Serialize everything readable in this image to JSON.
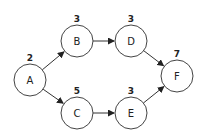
{
  "diagram": {
    "type": "activity-on-node network",
    "nodes": [
      {
        "id": "A",
        "label": "A",
        "duration": "2",
        "cx": 30,
        "cy": 80
      },
      {
        "id": "B",
        "label": "B",
        "duration": "3",
        "cx": 77,
        "cy": 41
      },
      {
        "id": "C",
        "label": "C",
        "duration": "5",
        "cx": 77,
        "cy": 113
      },
      {
        "id": "D",
        "label": "D",
        "duration": "3",
        "cx": 131,
        "cy": 41
      },
      {
        "id": "E",
        "label": "E",
        "duration": "3",
        "cx": 131,
        "cy": 113
      },
      {
        "id": "F",
        "label": "F",
        "duration": "7",
        "cx": 177,
        "cy": 76
      }
    ],
    "edges": [
      {
        "from": "A",
        "to": "B"
      },
      {
        "from": "A",
        "to": "C"
      },
      {
        "from": "B",
        "to": "D"
      },
      {
        "from": "C",
        "to": "E"
      },
      {
        "from": "D",
        "to": "F"
      },
      {
        "from": "E",
        "to": "F"
      }
    ],
    "radius": 16
  }
}
